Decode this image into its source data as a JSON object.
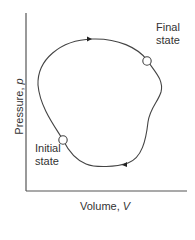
{
  "diagram": {
    "type": "pV-diagram cyclic process",
    "x_axis": {
      "label": "Volume, ",
      "symbol": "V"
    },
    "y_axis": {
      "label": "Pressure, ",
      "symbol": "p"
    },
    "points": [
      {
        "name": "final",
        "label_line1": "Final",
        "label_line2": "state"
      },
      {
        "name": "initial",
        "label_line1": "Initial",
        "label_line2": "state"
      }
    ],
    "path_direction": "clockwise",
    "colors": {
      "curve": "#444444",
      "axis": "#555555",
      "text": "#333333"
    }
  }
}
